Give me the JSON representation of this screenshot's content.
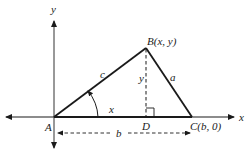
{
  "diagram": {
    "type": "triangle-coordinate-geometry",
    "axes": {
      "x_label": "x",
      "y_label": "y"
    },
    "points": {
      "A": {
        "label": "A"
      },
      "B": {
        "label": "B(x, y)"
      },
      "C": {
        "label": "C(b, 0)"
      },
      "D": {
        "label": "D"
      }
    },
    "sides": {
      "c": "c",
      "a": "a",
      "height": "y",
      "base_segment": "x",
      "base": "b"
    },
    "colors": {
      "line": "#1a1a1a",
      "axis": "#333333",
      "background": "#ffffff"
    }
  }
}
